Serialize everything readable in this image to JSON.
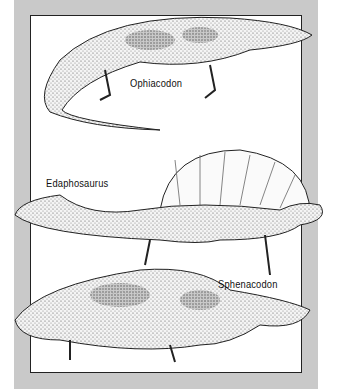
{
  "illustration": {
    "labels": [
      {
        "id": "ophiacodon",
        "text": "Ophiacodon"
      },
      {
        "id": "edaphosaurus",
        "text": "Edaphosaurus"
      },
      {
        "id": "sphenacodon",
        "text": "Sphenacodon"
      }
    ],
    "colors": {
      "panel": "#c9c9c9",
      "frame": "#ffffff",
      "ink": "#222222"
    }
  }
}
